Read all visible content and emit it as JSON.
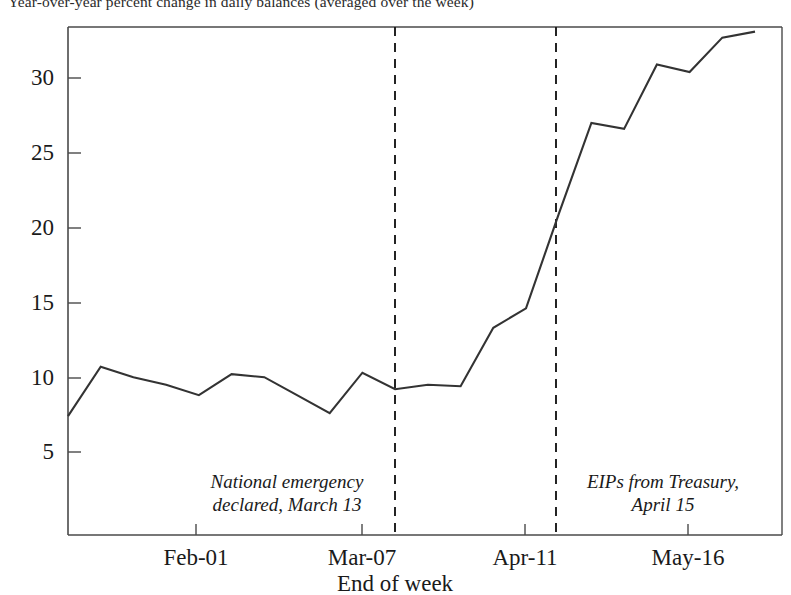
{
  "chart_data": {
    "type": "line",
    "title": "Year-over-year percent change in daily balances (averaged over the week)",
    "xlabel": "End of week",
    "ylabel": "",
    "grid": false,
    "legend": "none",
    "xlim": [
      0,
      24
    ],
    "ylim": [
      0,
      34
    ],
    "yticks": [
      5,
      10,
      15,
      20,
      25,
      30
    ],
    "ytick_labels": [
      "5",
      "10",
      "15",
      "20",
      "25",
      "30"
    ],
    "xticks": [
      4,
      9,
      14,
      19
    ],
    "xtick_labels": [
      "Feb-01",
      "Mar-07",
      "Apr-11",
      "May-16"
    ],
    "x": [
      0,
      1,
      2,
      3,
      4,
      5,
      6,
      7,
      8,
      9,
      10,
      11,
      12,
      13,
      14,
      15,
      16,
      17,
      18,
      19,
      20,
      21
    ],
    "values": [
      7.4,
      10.7,
      10.0,
      9.5,
      8.8,
      10.2,
      10.0,
      8.8,
      7.6,
      10.3,
      9.2,
      9.5,
      9.4,
      13.3,
      14.6,
      20.9,
      27.0,
      26.6,
      30.9,
      30.4,
      32.7,
      33.1
    ],
    "series": [
      {
        "name": "Year-over-year percent change in daily balances",
        "values": [
          7.4,
          10.7,
          10.0,
          9.5,
          8.8,
          10.2,
          10.0,
          8.8,
          7.6,
          10.3,
          9.2,
          9.5,
          9.4,
          13.3,
          14.6,
          20.9,
          27.0,
          26.6,
          30.9,
          30.4,
          32.7,
          33.1
        ],
        "color": "#333333"
      }
    ],
    "annotations": [
      {
        "id": "national-emergency",
        "text": "National emergency\ndeclared, March 13",
        "x": 10.0,
        "style": "italic",
        "vline": true,
        "vline_dash": "dashed"
      },
      {
        "id": "eips-from-treasury",
        "text": "EIPs from Treasury,\nApril 15",
        "x": 15.0,
        "style": "italic",
        "vline": true,
        "vline_dash": "dashed"
      }
    ],
    "vlines": [
      {
        "id": "vline-march-13",
        "x": 10.0,
        "dash": "dashed",
        "color": "#1a1a1a"
      },
      {
        "id": "vline-april-15",
        "x": 15.0,
        "dash": "dashed",
        "color": "#1a1a1a"
      }
    ],
    "colors": {
      "line": "#333333",
      "axis": "#4a4a4a",
      "text": "#1a1a1a",
      "background": "#ffffff"
    }
  },
  "axis": {
    "y_tick_labels": [
      "30",
      "25",
      "20",
      "15",
      "10",
      "5"
    ],
    "x_tick_labels": [
      "Feb-01",
      "Mar-07",
      "Apr-11",
      "May-16"
    ],
    "x_axis_title": "End of week"
  },
  "title": {
    "text": "Year-over-year percent change in daily balances (averaged over the week)"
  },
  "annotations": {
    "left": "National emergency\ndeclared, March 13",
    "right": "EIPs from Treasury,\nApril 15"
  }
}
